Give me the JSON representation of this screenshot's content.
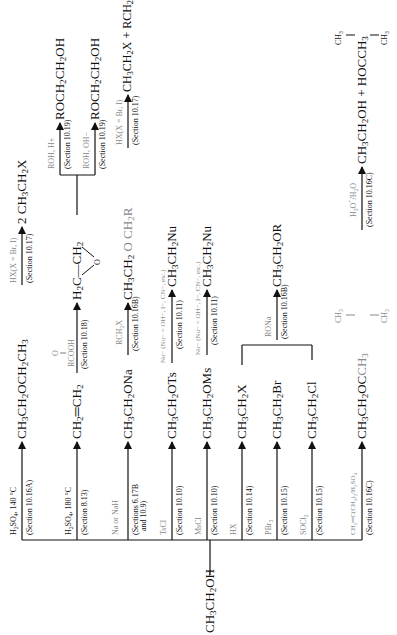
{
  "start": {
    "label": "CH3CH2OH"
  },
  "rows": [
    {
      "id": "ether",
      "reagent": "H2SO4, 140 °C",
      "section": "(Section 10.16A)",
      "product": "CH3CH2OCH2CH3",
      "next": {
        "reagent": "HX(X = Br, I)",
        "section": "(Section 10.17)",
        "product": "2 CH3CH2X"
      }
    },
    {
      "id": "ethene",
      "reagent": "H2SO4, 180 °C",
      "section": "(Section 8.13)",
      "product": "CH2=CH2",
      "next": {
        "reagent": "RCOOH (peroxy acid, C=O)",
        "section": "(Section 10.18)",
        "product": "H2C—CH2 (epoxide, O)",
        "branches": [
          {
            "reagent": "ROH, H+",
            "section": "(Section 10.19)",
            "product": "ROCH2CH2OH"
          },
          {
            "reagent": "ROH, OH−",
            "section": "(Section 10.19)",
            "product": "ROCH2CH2OH"
          }
        ]
      }
    },
    {
      "id": "alkoxide",
      "reagent": "Na or NaH",
      "section": "(Sections 6.17B and 10.9)",
      "product": "CH3CH2ONa",
      "next": {
        "reagent": "RCH2X",
        "section": "(Section 10.16B)",
        "product": "CH3CH2 O CH2R",
        "then": {
          "reagent": "HX(X = Br, I)",
          "section": "(Section 10.17)",
          "product": "CH3CH2X + RCH2X"
        }
      }
    },
    {
      "id": "tosylate",
      "reagent": "TsCl",
      "section": "(Section 10.10)",
      "product": "CH3CH2OTs",
      "next": {
        "reagent": "Nu− (Nu− = OH−, I−, CN−, etc.)",
        "section": "(Section 10.11)",
        "product": "CH3CH2Nu"
      }
    },
    {
      "id": "mesylate",
      "reagent": "MsCl",
      "section": "(Section 10.10)",
      "product": "CH3CH2OMs",
      "next": {
        "reagent": "Nu− (Nu− = OH−, I−, CN−, etc.)",
        "section": "(Section 10.11)",
        "product": "CH3CH2Nu"
      }
    },
    {
      "id": "halide",
      "reagent": "HX",
      "section": "(Section 10.14)",
      "product": "CH3CH2X"
    },
    {
      "id": "bromide",
      "reagent": "PBr3",
      "section": "(Section 10.15)",
      "product": "CH3CH2Br"
    },
    {
      "id": "chloride",
      "reagent": "SOCl2",
      "section": "(Section 10.15)",
      "product": "CH3CH2Cl"
    },
    {
      "id": "tbutyl",
      "reagent": "CH2=C(CH3)2/H2SO4",
      "section": "(Section 10.16C)",
      "product": "CH3CH2OC(CH3)3",
      "next": {
        "reagent": "H3O+/H2O",
        "section": "(Section 10.16C)",
        "product": "CH3CH2OH + HOC(CH3)3"
      }
    }
  ],
  "halide_merge": {
    "reagent": "RONa",
    "section": "(Section 10.16B)",
    "product": "CH3CH2OR"
  }
}
